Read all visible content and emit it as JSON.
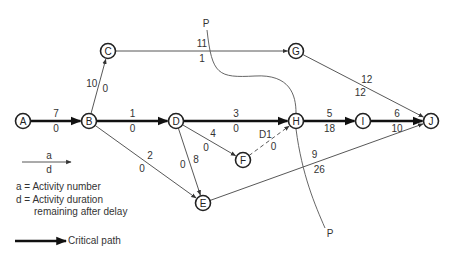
{
  "diagram": {
    "nodes": [
      {
        "id": "A",
        "label": "A",
        "x": 23,
        "y": 121
      },
      {
        "id": "B",
        "label": "B",
        "x": 89,
        "y": 121
      },
      {
        "id": "C",
        "label": "C",
        "x": 108,
        "y": 51
      },
      {
        "id": "D",
        "label": "D",
        "x": 176,
        "y": 121
      },
      {
        "id": "E",
        "label": "E",
        "x": 203,
        "y": 203
      },
      {
        "id": "F",
        "label": "F",
        "x": 243,
        "y": 160
      },
      {
        "id": "G",
        "label": "G",
        "x": 296,
        "y": 51
      },
      {
        "id": "H",
        "label": "H",
        "x": 296,
        "y": 121
      },
      {
        "id": "I",
        "label": "I",
        "x": 363,
        "y": 121
      },
      {
        "id": "J",
        "label": "J",
        "x": 431,
        "y": 121
      }
    ],
    "edges": [
      {
        "from": "A",
        "to": "B",
        "activity": "7",
        "duration": "0",
        "critical": true
      },
      {
        "from": "B",
        "to": "C",
        "activity": "10",
        "duration": "0",
        "critical": false
      },
      {
        "from": "B",
        "to": "D",
        "activity": "1",
        "duration": "0",
        "critical": true
      },
      {
        "from": "B",
        "to": "E",
        "activity": "2",
        "duration": "0",
        "critical": false
      },
      {
        "from": "C",
        "to": "G",
        "activity": "11",
        "duration": "1",
        "critical": false
      },
      {
        "from": "D",
        "to": "H",
        "activity": "3",
        "duration": "0",
        "critical": true
      },
      {
        "from": "D",
        "to": "F",
        "activity": "4",
        "duration": "0",
        "critical": false
      },
      {
        "from": "D",
        "to": "E",
        "activity": "8",
        "duration": "0",
        "critical": false
      },
      {
        "from": "F",
        "to": "H",
        "activity": "D1",
        "duration": "0",
        "critical": false,
        "dummy": true
      },
      {
        "from": "G",
        "to": "J",
        "activity": "12",
        "duration": "12",
        "critical": false
      },
      {
        "from": "H",
        "to": "I",
        "activity": "5",
        "duration": "18",
        "critical": true
      },
      {
        "from": "I",
        "to": "J",
        "activity": "6",
        "duration": "10",
        "critical": true
      },
      {
        "from": "E",
        "to": "J",
        "activity": "9",
        "duration": "26",
        "critical": false
      }
    ],
    "cut_line": {
      "label_top": "P",
      "label_bottom": "P"
    }
  },
  "legend": {
    "arrow_top_label": "a",
    "arrow_bottom_label": "d",
    "a_definition": "a = Activity number",
    "d_definition_line1": "d = Activity duration",
    "d_definition_line2": "remaining after delay",
    "critical_path_label": "Critical path"
  }
}
